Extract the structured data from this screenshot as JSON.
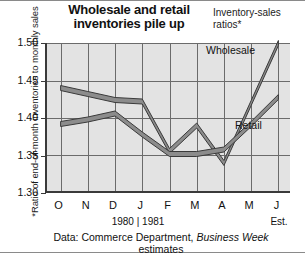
{
  "title": "Wholesale and retail\ninventories pile up",
  "title_line1": "Wholesale and retail",
  "title_line2": "inventories pile up",
  "subtitle_line1": "Inventory-sales",
  "subtitle_line2": "ratios*",
  "y_axis_caption": "*Ratio of end-of-month inventories to monthly sales",
  "year_span": "1980 | 1981",
  "est_label": "Est.",
  "source_line1_a": "Data: Commerce Department, ",
  "source_line1_b": "Business Week",
  "source_line2": "estimates",
  "colors": {
    "plot_background": "#e3e3e3",
    "grid": "#6b6b6b",
    "axis": "#3a3a3a",
    "series_fill": "#8c8c8c",
    "series_stroke": "#3a3a3a",
    "text": "#111111",
    "page_background": "#ffffff"
  },
  "chart_data": {
    "type": "line",
    "title": "Wholesale and retail inventories pile up",
    "subtitle": "Inventory-sales ratios*",
    "xlabel": "",
    "ylabel": "*Ratio of end-of-month inventories to monthly sales",
    "x": [
      "O",
      "N",
      "D",
      "J",
      "F",
      "M",
      "A",
      "M",
      "J"
    ],
    "categories": [
      "O",
      "N",
      "D",
      "J",
      "F",
      "M",
      "A",
      "M",
      "J"
    ],
    "ylim": [
      1.3,
      1.5
    ],
    "yticks": [
      "1.30",
      "1.35",
      "1.40",
      "1.45",
      "1.50"
    ],
    "ytick_values": [
      1.3,
      1.35,
      1.4,
      1.45,
      1.5
    ],
    "grid": true,
    "legend": "inline-labels",
    "annotations": [
      "1980 | 1981",
      "Est."
    ],
    "source": "Data: Commerce Department, Business Week estimates",
    "series": [
      {
        "name": "Wholesale",
        "values": [
          1.44,
          1.432,
          1.424,
          1.422,
          1.356,
          1.39,
          1.34,
          1.42,
          1.5
        ]
      },
      {
        "name": "Retail",
        "values": [
          1.392,
          1.398,
          1.406,
          1.378,
          1.352,
          1.352,
          1.358,
          1.392,
          1.428
        ]
      }
    ]
  }
}
